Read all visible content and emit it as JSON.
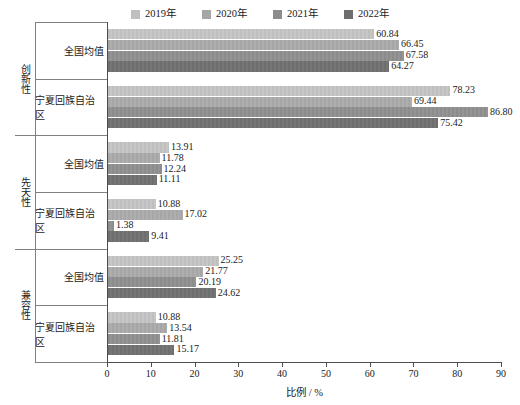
{
  "chart_data": {
    "type": "bar",
    "orientation": "horizontal",
    "title": "",
    "xlabel": "比例 / %",
    "ylabel": "",
    "xlim": [
      0,
      90
    ],
    "xticks": [
      0,
      10,
      20,
      30,
      40,
      50,
      60,
      70,
      80,
      90
    ],
    "grid": false,
    "legend_position": "top-center",
    "series": [
      {
        "name": "2019年",
        "color": "#bfbfbf",
        "values": [
          60.84,
          78.23,
          13.91,
          10.88,
          25.25,
          10.88
        ]
      },
      {
        "name": "2020年",
        "color": "#a6a6a6",
        "values": [
          66.45,
          69.44,
          11.78,
          17.02,
          21.77,
          13.54
        ]
      },
      {
        "name": "2021年",
        "color": "#8c8c8c",
        "values": [
          67.58,
          86.8,
          12.24,
          1.38,
          20.19,
          11.81
        ]
      },
      {
        "name": "2022年",
        "color": "#6e6e6e",
        "values": [
          64.27,
          75.42,
          11.11,
          9.41,
          24.62,
          15.17
        ]
      }
    ],
    "categories": [
      "全国均值",
      "宁夏回族自治区",
      "全国均值",
      "宁夏回族自治区",
      "全国均值",
      "宁夏回族自治区"
    ],
    "groups": [
      {
        "label": "创新性",
        "rows": [
          "全国均值",
          "宁夏回族自治区"
        ]
      },
      {
        "label": "先天性",
        "rows": [
          "全国均值",
          "宁夏回族自治区"
        ]
      },
      {
        "label": "兼容性",
        "rows": [
          "全国均值",
          "宁夏回族自治区"
        ]
      }
    ],
    "data_labels": [
      [
        "60.84",
        "66.45",
        "67.58",
        "64.27"
      ],
      [
        "78.23",
        "69.44",
        "86.80",
        "75.42"
      ],
      [
        "13.91",
        "11.78",
        "12.24",
        "11.11"
      ],
      [
        "10.88",
        "17.02",
        "1.38",
        "9.41"
      ],
      [
        "25.25",
        "21.77",
        "20.19",
        "24.62"
      ],
      [
        "10.88",
        "13.54",
        "11.81",
        "15.17"
      ]
    ]
  },
  "legend": {
    "items": [
      {
        "label": "2019年",
        "color": "#bfbfbf"
      },
      {
        "label": "2020年",
        "color": "#a6a6a6"
      },
      {
        "label": "2021年",
        "color": "#8c8c8c"
      },
      {
        "label": "2022年",
        "color": "#6e6e6e"
      }
    ]
  },
  "axis": {
    "x_title": "比例 / %",
    "x_tick_labels": [
      "0",
      "10",
      "20",
      "30",
      "40",
      "50",
      "60",
      "70",
      "80",
      "90"
    ]
  },
  "row_labels": [
    "全国均值",
    "宁夏回族自治区",
    "全国均值",
    "宁夏回族自治区",
    "全国均值",
    "宁夏回族自治区"
  ],
  "group_labels": [
    "创新性",
    "先天性",
    "兼容性"
  ]
}
